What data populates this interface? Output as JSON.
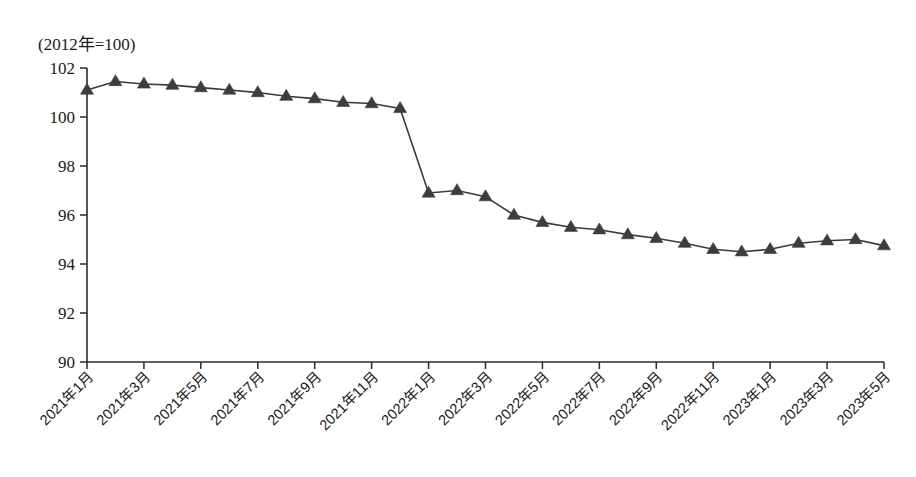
{
  "chart_data": {
    "type": "line",
    "title": "(2012年=100)",
    "xlabel": "",
    "ylabel": "",
    "ylim": [
      90,
      102
    ],
    "ytick_step": 2,
    "yticks": [
      90,
      92,
      94,
      96,
      98,
      100,
      102
    ],
    "grid": false,
    "legend": "none",
    "marker": "triangle",
    "line_color": "#3d3d3d",
    "marker_color": "#3d3d3d",
    "x": [
      "2021年1月",
      "2021年2月",
      "2021年3月",
      "2021年4月",
      "2021年5月",
      "2021年6月",
      "2021年7月",
      "2021年8月",
      "2021年9月",
      "2021年10月",
      "2021年11月",
      "2021年12月",
      "2022年1月",
      "2022年2月",
      "2022年3月",
      "2022年4月",
      "2022年5月",
      "2022年6月",
      "2022年7月",
      "2022年8月",
      "2022年9月",
      "2022年10月",
      "2022年11月",
      "2022年12月",
      "2023年1月",
      "2023年2月",
      "2023年3月",
      "2023年4月",
      "2023年5月"
    ],
    "xtick_labels": [
      "2021年1月",
      "2021年3月",
      "2021年5月",
      "2021年7月",
      "2021年9月",
      "2021年11月",
      "2022年1月",
      "2022年3月",
      "2022年5月",
      "2022年7月",
      "2022年9月",
      "2022年11月",
      "2023年1月",
      "2023年3月",
      "2023年5月"
    ],
    "values": [
      101.1,
      101.45,
      101.35,
      101.3,
      101.2,
      101.1,
      101.0,
      100.85,
      100.75,
      100.6,
      100.55,
      100.35,
      96.9,
      97.0,
      96.75,
      96.0,
      95.7,
      95.5,
      95.4,
      95.2,
      95.05,
      94.85,
      94.6,
      94.5,
      94.6,
      94.85,
      94.95,
      95.0,
      94.75
    ]
  }
}
